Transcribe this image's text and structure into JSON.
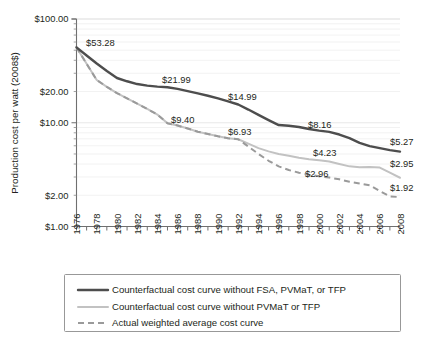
{
  "chart_data": {
    "type": "line",
    "title": "",
    "xlabel": "",
    "ylabel": "Production cost per watt (2008$)",
    "xlim": [
      1976,
      2008
    ],
    "ylim": [
      1,
      100
    ],
    "yscale": "log",
    "grid": true,
    "legend_position": "bottom",
    "ytick_labels": [
      "$100.00",
      "$20.00",
      "$10.00",
      "$2.00",
      "$1.00"
    ],
    "ytick_values": [
      100,
      20,
      10,
      2,
      1
    ],
    "xtick_labels": [
      "1976",
      "1978",
      "1980",
      "1982",
      "1984",
      "1986",
      "1988",
      "1990",
      "1992",
      "1994",
      "1996",
      "1998",
      "2000",
      "2002",
      "2004",
      "2006",
      "2008"
    ],
    "xtick_values": [
      1976,
      1978,
      1980,
      1982,
      1984,
      1986,
      1988,
      1990,
      1992,
      1994,
      1996,
      1998,
      2000,
      2002,
      2004,
      2006,
      2008
    ],
    "x": [
      1976,
      1977,
      1978,
      1979,
      1980,
      1981,
      1982,
      1983,
      1984,
      1985,
      1986,
      1987,
      1988,
      1989,
      1990,
      1991,
      1992,
      1993,
      1994,
      1995,
      1996,
      1997,
      1998,
      1999,
      2000,
      2001,
      2002,
      2003,
      2004,
      2005,
      2006,
      2007,
      2008
    ],
    "series": [
      {
        "name": "Counterfactual cost curve without FSA, PVMaT, or TFP",
        "style": "solid-dark",
        "color": "#4d4d4d",
        "values": [
          53.28,
          44.5,
          37.2,
          31.5,
          27.0,
          25.1,
          23.6,
          22.8,
          22.3,
          21.99,
          21.2,
          20.2,
          19.2,
          18.2,
          17.2,
          16.1,
          14.99,
          13.4,
          11.9,
          10.6,
          9.5,
          9.35,
          9.1,
          8.7,
          8.4,
          8.16,
          7.7,
          7.1,
          6.4,
          5.95,
          5.7,
          5.45,
          5.27
        ]
      },
      {
        "name": "Counterfactual cost curve without PVMaT or TFP",
        "style": "solid-light",
        "color": "#c2c2c2",
        "values": [
          53.28,
          37.0,
          25.8,
          22.2,
          19.3,
          17.2,
          15.3,
          13.6,
          12.0,
          9.9,
          9.4,
          8.8,
          8.2,
          7.8,
          7.4,
          7.1,
          6.93,
          6.3,
          5.7,
          5.3,
          5.0,
          4.8,
          4.6,
          4.45,
          4.35,
          4.23,
          4.0,
          3.8,
          3.72,
          3.75,
          3.7,
          3.3,
          2.95
        ]
      },
      {
        "name": "Actual weighted average cost curve",
        "style": "dashed",
        "color": "#9a9a9a",
        "values": [
          53.28,
          37.0,
          25.8,
          22.2,
          19.3,
          17.2,
          15.3,
          13.6,
          12.0,
          9.9,
          9.4,
          8.8,
          8.2,
          7.8,
          7.4,
          7.1,
          6.93,
          5.9,
          5.0,
          4.3,
          3.8,
          3.5,
          3.3,
          3.15,
          3.05,
          2.96,
          2.85,
          2.7,
          2.6,
          2.5,
          2.2,
          1.95,
          1.92
        ]
      }
    ],
    "annotations": [
      {
        "text": "$53.28",
        "x": 1976,
        "value": 53.28,
        "px": 86,
        "py": 46,
        "anchor": "start"
      },
      {
        "text": "$21.99",
        "x": 1985,
        "value": 21.99,
        "px": 162,
        "py": 83,
        "anchor": "start"
      },
      {
        "text": "$14.99",
        "x": 1992,
        "value": 14.99,
        "px": 228,
        "py": 100,
        "anchor": "start"
      },
      {
        "text": "$9.40",
        "x": 1986,
        "value": 9.4,
        "px": 171,
        "py": 123,
        "anchor": "start"
      },
      {
        "text": "$6.93",
        "x": 1992,
        "value": 6.93,
        "px": 228,
        "py": 135,
        "anchor": "start"
      },
      {
        "text": "$8.16",
        "x": 2001,
        "value": 8.16,
        "px": 308,
        "py": 128,
        "anchor": "start"
      },
      {
        "text": "$5.27",
        "x": 2008,
        "value": 5.27,
        "px": 390,
        "py": 145,
        "anchor": "start"
      },
      {
        "text": "$4.23",
        "x": 2001,
        "value": 4.23,
        "px": 313,
        "py": 156,
        "anchor": "start"
      },
      {
        "text": "$2.95",
        "x": 2008,
        "value": 2.95,
        "px": 390,
        "py": 167,
        "anchor": "start"
      },
      {
        "text": "$2.96",
        "x": 2001,
        "value": 2.96,
        "px": 305,
        "py": 177,
        "anchor": "start"
      },
      {
        "text": "$1.92",
        "x": 2008,
        "value": 1.92,
        "px": 390,
        "py": 191,
        "anchor": "start"
      }
    ]
  },
  "axis": {
    "y_title": "Production cost per watt (2008$)",
    "y_ticks": [
      {
        "label": "$100.00",
        "value": 100
      },
      {
        "label": "$20.00",
        "value": 20
      },
      {
        "label": "$10.00",
        "value": 10
      },
      {
        "label": "$2.00",
        "value": 2
      },
      {
        "label": "$1.00",
        "value": 1
      }
    ],
    "x_ticks": [
      {
        "label": "1976"
      },
      {
        "label": "1978"
      },
      {
        "label": "1980"
      },
      {
        "label": "1982"
      },
      {
        "label": "1984"
      },
      {
        "label": "1986"
      },
      {
        "label": "1988"
      },
      {
        "label": "1990"
      },
      {
        "label": "1992"
      },
      {
        "label": "1994"
      },
      {
        "label": "1996"
      },
      {
        "label": "1998"
      },
      {
        "label": "2000"
      },
      {
        "label": "2002"
      },
      {
        "label": "2004"
      },
      {
        "label": "2006"
      },
      {
        "label": "2008"
      }
    ]
  },
  "legend": {
    "items": [
      {
        "label": "Counterfactual cost curve without FSA, PVMaT, or TFP",
        "style": "solid-dark",
        "color": "#4d4d4d"
      },
      {
        "label": "Counterfactual cost curve without PVMaT or TFP",
        "style": "solid-light",
        "color": "#c2c2c2"
      },
      {
        "label": "Actual weighted average cost curve",
        "style": "dashed",
        "color": "#9a9a9a"
      }
    ]
  }
}
